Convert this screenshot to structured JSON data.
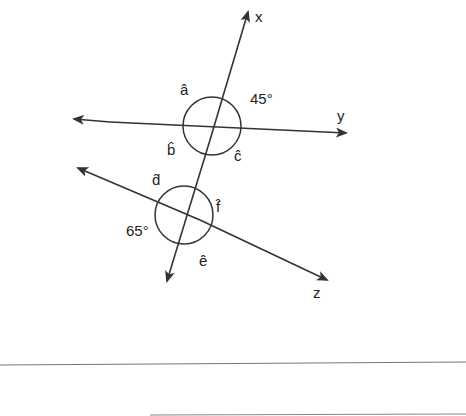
{
  "diagram": {
    "type": "geometry-transversal",
    "lines": [
      {
        "name": "x",
        "label": "x",
        "role": "transversal"
      },
      {
        "name": "y",
        "label": "y"
      },
      {
        "name": "z",
        "label": "z"
      }
    ],
    "angles": {
      "a": "â",
      "b": "b̂",
      "c": "ĉ",
      "d": "d̂",
      "e": "ê",
      "f": "f̂",
      "given_upper": "45°",
      "given_lower": "65°"
    },
    "colors": {
      "stroke": "#333333",
      "background": "#ffffff"
    }
  }
}
